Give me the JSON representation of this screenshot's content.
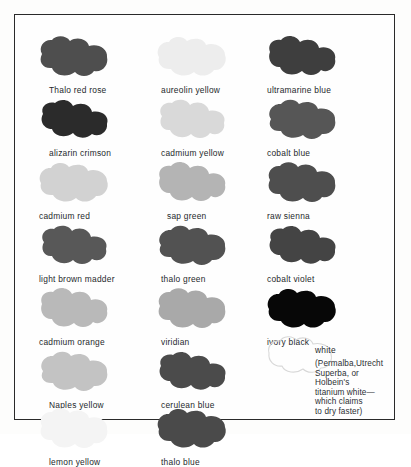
{
  "document": {
    "kind": "paint-palette-chart",
    "background_color": "#fdfdfc",
    "frame_border_color": "#2a2a2a",
    "label_text_color": "#25292c"
  },
  "columns": [
    {
      "name": "column-1",
      "swatches": [
        {
          "label": "Thalo red rose",
          "color": "#4e4e4e",
          "y": 20,
          "label_indent": "indent-a"
        },
        {
          "label": "alizarin crimson",
          "color": "#2b2b2b",
          "y": 83,
          "label_indent": "indent-a"
        },
        {
          "label": "cadmium red",
          "color": "#d2d2d2",
          "y": 146,
          "label_indent": "indent-c"
        },
        {
          "label": "light brown madder",
          "color": "#585858",
          "y": 209,
          "label_indent": "indent-c"
        },
        {
          "label": "cadmium orange",
          "color": "#b9b9b9",
          "y": 272,
          "label_indent": "indent-c"
        },
        {
          "label": "Naples yellow",
          "color": "#c3c3c3",
          "y": 335,
          "label_indent": "indent-a"
        },
        {
          "label": "lemon yellow",
          "color": "#f4f4f4",
          "y": 392,
          "label_indent": "indent-a"
        }
      ]
    },
    {
      "name": "column-2",
      "swatches": [
        {
          "label": "aureolin yellow",
          "color": "#ededed",
          "y": 20,
          "label_indent": "indent-b"
        },
        {
          "label": "cadmium yellow",
          "color": "#d9d9d9",
          "y": 83,
          "label_indent": "indent-b"
        },
        {
          "label": "sap green",
          "color": "#b4b4b4",
          "y": 146,
          "label_indent": "indent-a"
        },
        {
          "label": "thalo green",
          "color": "#525252",
          "y": 209,
          "label_indent": "indent-b"
        },
        {
          "label": "viridian",
          "color": "#a9a9a9",
          "y": 272,
          "label_indent": "indent-b"
        },
        {
          "label": "cerulean blue",
          "color": "#4b4b4b",
          "y": 335,
          "label_indent": "indent-b"
        },
        {
          "label": "thalo blue",
          "color": "#4a4a4a",
          "y": 392,
          "label_indent": "indent-b"
        }
      ]
    },
    {
      "name": "column-3",
      "swatches": [
        {
          "label": "ultramarine blue",
          "color": "#3e3e3e",
          "y": 20,
          "label_indent": "indent-c"
        },
        {
          "label": "cobalt blue",
          "color": "#565656",
          "y": 83,
          "label_indent": "indent-c"
        },
        {
          "label": "raw sienna",
          "color": "#4e4e4e",
          "y": 146,
          "label_indent": "indent-c"
        },
        {
          "label": "cobalt violet",
          "color": "#444444",
          "y": 209,
          "label_indent": "indent-c"
        },
        {
          "label": "ivory black",
          "color": "#070707",
          "y": 272,
          "label_indent": "indent-c"
        }
      ]
    }
  ],
  "white_entry": {
    "name": "white",
    "blob_color": "#ffffff",
    "blob_outline_color": "#d8d8d8",
    "title": "white",
    "note": "(Permalba,Utrecht\nSuperba, or\nHolbein's\ntitanium white—\nwhich claims\nto dry faster)"
  }
}
